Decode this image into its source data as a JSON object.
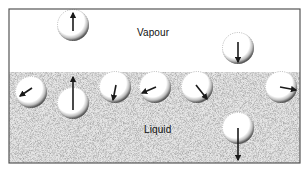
{
  "diagram": {
    "type": "evaporation-molecules",
    "frame": {
      "x": 9,
      "y": 9,
      "width": 291,
      "height": 154,
      "border_color": "#555555"
    },
    "surface_y": 72,
    "regions": {
      "vapour": {
        "label": "Vapour",
        "fill": "#ffffff"
      },
      "liquid": {
        "label": "Liquid",
        "fill": "#e6e6e6",
        "stipple": "#9a9a9a"
      }
    },
    "molecule_radius": 16,
    "molecules": [
      {
        "id": "m1",
        "region": "vapour",
        "cx": 73,
        "cy": 25,
        "arrow": {
          "x1": 73,
          "y1": 31,
          "x2": 73,
          "y2": 13
        }
      },
      {
        "id": "m2",
        "region": "vapour",
        "cx": 238,
        "cy": 48,
        "arrow": {
          "x1": 238,
          "y1": 42,
          "x2": 238,
          "y2": 62
        }
      },
      {
        "id": "m3",
        "region": "liquid",
        "cx": 31,
        "cy": 92,
        "arrow": {
          "x1": 32,
          "y1": 88,
          "x2": 20,
          "y2": 96
        }
      },
      {
        "id": "m4",
        "region": "liquid",
        "cx": 73,
        "cy": 103,
        "arrow": {
          "x1": 73,
          "y1": 110,
          "x2": 73,
          "y2": 77
        }
      },
      {
        "id": "m5",
        "region": "liquid",
        "cx": 115,
        "cy": 87,
        "arrow": {
          "x1": 116,
          "y1": 85,
          "x2": 113,
          "y2": 100
        }
      },
      {
        "id": "m6",
        "region": "liquid",
        "cx": 155,
        "cy": 87,
        "arrow": {
          "x1": 156,
          "y1": 87,
          "x2": 142,
          "y2": 93
        }
      },
      {
        "id": "m7",
        "region": "liquid",
        "cx": 197,
        "cy": 87,
        "arrow": {
          "x1": 196,
          "y1": 85,
          "x2": 207,
          "y2": 99
        }
      },
      {
        "id": "m8",
        "region": "liquid",
        "cx": 281,
        "cy": 87,
        "arrow": {
          "x1": 280,
          "y1": 87,
          "x2": 296,
          "y2": 90
        }
      },
      {
        "id": "m9",
        "region": "liquid",
        "cx": 238,
        "cy": 128,
        "arrow": {
          "x1": 238,
          "y1": 128,
          "x2": 238,
          "y2": 160
        }
      }
    ],
    "colors": {
      "arrow": "#1a1a1a",
      "molecule_fill": "#ffffff",
      "molecule_shade": "#333333"
    }
  }
}
